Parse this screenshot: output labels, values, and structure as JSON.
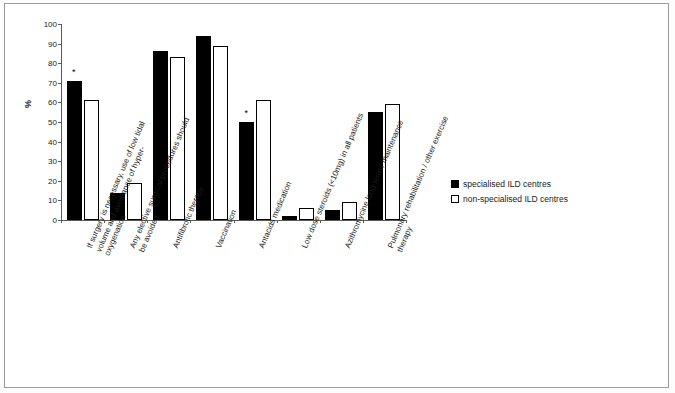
{
  "chart_data": {
    "type": "bar",
    "title": "",
    "xlabel": "",
    "ylabel": "%",
    "ylim": [
      0,
      100
    ],
    "yticks": [
      0,
      10,
      20,
      30,
      40,
      50,
      60,
      70,
      80,
      90,
      100
    ],
    "grid": false,
    "legend_position": "right",
    "categories": [
      "If surgery is necessary, use of low tidal volume and avoidance of hyper-oxygenation",
      "Any elective surgical procedures should be avoided",
      "Antifibrotic therapy",
      "Vaccination",
      "Antacids medication",
      "Low dose steroids (<10mg) in all patients",
      "Azithromycine long term / maintenance",
      "Pulmonary rehabilitation / other exercise therapy"
    ],
    "series": [
      {
        "name": "specialised ILD centres",
        "style": "filled",
        "values": [
          71,
          14,
          86,
          94,
          50,
          2,
          5,
          55
        ]
      },
      {
        "name": "non-specialised ILD centres",
        "style": "open",
        "values": [
          61,
          19,
          83,
          89,
          61,
          6,
          9,
          59
        ]
      }
    ],
    "annotations": [
      {
        "text": "*",
        "category_index": 0
      },
      {
        "text": "*",
        "category_index": 4
      }
    ]
  },
  "legend": {
    "items": [
      {
        "label": "specialised ILD centres",
        "style": "filled"
      },
      {
        "label": "non-specialised ILD centres",
        "style": "open"
      }
    ]
  }
}
